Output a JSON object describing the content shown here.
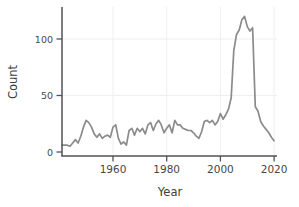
{
  "chart_data": {
    "type": "line",
    "title": "",
    "xlabel": "Year",
    "ylabel": "Count",
    "x_ticks": [
      "1960",
      "1980",
      "2000",
      "2020"
    ],
    "y_ticks": [
      "0",
      "50",
      "100"
    ],
    "xlim": [
      1941,
      2021
    ],
    "ylim": [
      0,
      128
    ],
    "grid": true,
    "legend": "none",
    "line_color": "#8b8b8b",
    "axis_color": "#50505a",
    "label_color": "#3d3d3d",
    "grid_color": "#efefef",
    "series": [
      {
        "name": "count",
        "x": [
          1941,
          1942,
          1943,
          1944,
          1945,
          1946,
          1947,
          1948,
          1949,
          1950,
          1951,
          1952,
          1953,
          1954,
          1955,
          1956,
          1957,
          1958,
          1959,
          1960,
          1961,
          1962,
          1963,
          1964,
          1965,
          1966,
          1967,
          1968,
          1969,
          1970,
          1971,
          1972,
          1973,
          1974,
          1975,
          1976,
          1977,
          1978,
          1979,
          1980,
          1981,
          1982,
          1983,
          1984,
          1985,
          1986,
          1987,
          1988,
          1989,
          1990,
          1991,
          1992,
          1993,
          1994,
          1995,
          1996,
          1997,
          1998,
          1999,
          2000,
          2001,
          2002,
          2003,
          2004,
          2005,
          2006,
          2007,
          2008,
          2009,
          2010,
          2011,
          2012,
          2013,
          2014,
          2015,
          2016,
          2017,
          2018,
          2019,
          2020
        ],
        "values": [
          6,
          6,
          6,
          5,
          8,
          11,
          8,
          14,
          22,
          28,
          26,
          22,
          16,
          13,
          16,
          12,
          14,
          15,
          13,
          22,
          24,
          12,
          7,
          9,
          6,
          19,
          21,
          15,
          21,
          18,
          21,
          16,
          24,
          26,
          19,
          25,
          28,
          24,
          17,
          21,
          24,
          17,
          28,
          24,
          24,
          21,
          20,
          19,
          19,
          17,
          14,
          12,
          18,
          27,
          28,
          26,
          28,
          24,
          27,
          34,
          29,
          33,
          38,
          48,
          90,
          104,
          108,
          117,
          120,
          111,
          107,
          110,
          40,
          36,
          27,
          23,
          20,
          17,
          13,
          10
        ]
      }
    ]
  }
}
